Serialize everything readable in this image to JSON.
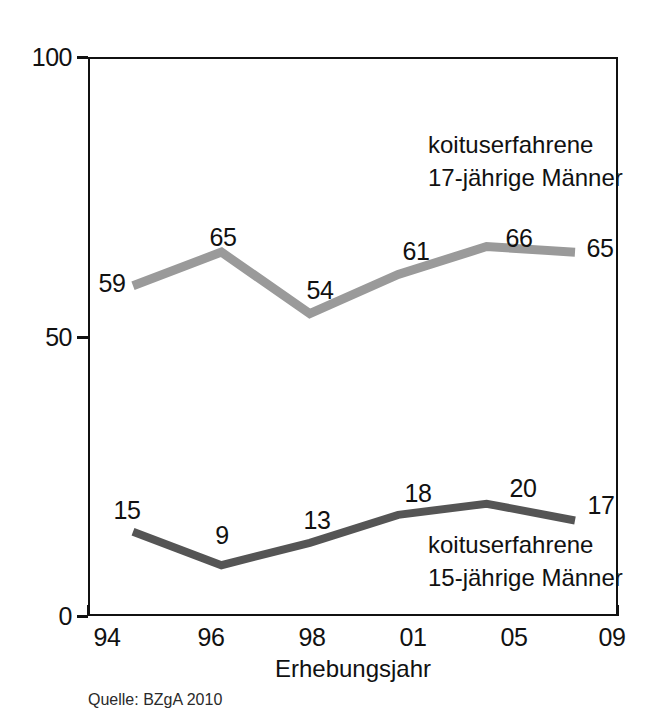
{
  "chart_data": {
    "type": "line",
    "title": "",
    "subtitle": "",
    "xlabel": "Erhebungsjahr",
    "ylabel": "",
    "categories": [
      "94",
      "96",
      "98",
      "01",
      "05",
      "09"
    ],
    "x": [
      "94",
      "96",
      "98",
      "01",
      "05",
      "09"
    ],
    "ylim": [
      0,
      100
    ],
    "y_ticks": [
      "0",
      "50",
      "100"
    ],
    "y_tick_values": [
      0,
      50,
      100
    ],
    "grid": false,
    "legend_position": "inline-annotation",
    "series": [
      {
        "name": "koituserfahrene 17-jährige Männer",
        "color": "#9a9a9a",
        "values": [
          59,
          65,
          54,
          61,
          66,
          65
        ],
        "labels": [
          "59",
          "65",
          "54",
          "61",
          "66",
          "65"
        ]
      },
      {
        "name": "koituserfahrene 15-jährige Männer",
        "color": "#555555",
        "values": [
          15,
          9,
          13,
          18,
          20,
          17
        ],
        "labels": [
          "15",
          "9",
          "13",
          "18",
          "20",
          "17"
        ]
      }
    ],
    "annotations": [
      {
        "id": "upper",
        "lines": [
          "koituserfahrene",
          "17-jährige Männer"
        ],
        "for_series": "koituserfahrene 17-jährige Männer"
      },
      {
        "id": "lower",
        "lines": [
          "koituserfahrene",
          "15-jährige Männer"
        ],
        "for_series": "koituserfahrene 15-jährige Männer"
      }
    ],
    "source": "Quelle: BZgA 2010"
  },
  "colors": {
    "axis": "#111111",
    "text": "#111111",
    "background": "#ffffff",
    "series_upper": "#9a9a9a",
    "series_lower": "#555555"
  }
}
